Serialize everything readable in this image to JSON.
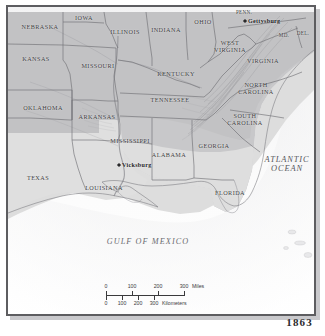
{
  "map": {
    "year": "1863",
    "states": [
      {
        "name": "NEBRASKA",
        "x": 40,
        "y": 27,
        "size": "state"
      },
      {
        "name": "IOWA",
        "x": 84,
        "y": 18,
        "size": "state"
      },
      {
        "name": "ILLINOIS",
        "x": 125,
        "y": 32,
        "size": "state"
      },
      {
        "name": "INDIANA",
        "x": 166,
        "y": 30,
        "size": "state"
      },
      {
        "name": "OHIO",
        "x": 203,
        "y": 22,
        "size": "state"
      },
      {
        "name": "PENN.",
        "x": 244,
        "y": 13,
        "size": "state-sm"
      },
      {
        "name": "MD.",
        "x": 284,
        "y": 36,
        "size": "state-sm"
      },
      {
        "name": "DEL.",
        "x": 303,
        "y": 34,
        "size": "state-sm"
      },
      {
        "name": "KANSAS",
        "x": 36,
        "y": 59,
        "size": "state"
      },
      {
        "name": "MISSOURI",
        "x": 98,
        "y": 66,
        "size": "state"
      },
      {
        "name": "KENTUCKY",
        "x": 176,
        "y": 74,
        "size": "state"
      },
      {
        "name": "WEST\nVIRGINIA",
        "x": 230,
        "y": 47,
        "size": "state"
      },
      {
        "name": "VIRGINIA",
        "x": 263,
        "y": 61,
        "size": "state"
      },
      {
        "name": "OKLAHOMA",
        "x": 43,
        "y": 108,
        "size": "state"
      },
      {
        "name": "ARKANSAS",
        "x": 97,
        "y": 117,
        "size": "state"
      },
      {
        "name": "TENNESSEE",
        "x": 170,
        "y": 100,
        "size": "state"
      },
      {
        "name": "NORTH\nCAROLINA",
        "x": 256,
        "y": 89,
        "size": "state"
      },
      {
        "name": "SOUTH\nCAROLINA",
        "x": 245,
        "y": 120,
        "size": "state"
      },
      {
        "name": "MISSISSIPPI",
        "x": 130,
        "y": 141,
        "size": "state"
      },
      {
        "name": "ALABAMA",
        "x": 169,
        "y": 155,
        "size": "state"
      },
      {
        "name": "GEORGIA",
        "x": 214,
        "y": 146,
        "size": "state"
      },
      {
        "name": "TEXAS",
        "x": 38,
        "y": 178,
        "size": "state"
      },
      {
        "name": "LOUISIANA",
        "x": 104,
        "y": 188,
        "size": "state"
      },
      {
        "name": "FLORIDA",
        "x": 230,
        "y": 193,
        "size": "state"
      }
    ],
    "water_labels": [
      {
        "name": "ATLANTIC\nOCEAN",
        "x": 287,
        "y": 165,
        "kind": "ocean"
      },
      {
        "name": "GULF OF MEXICO",
        "x": 148,
        "y": 242,
        "kind": "gulf"
      }
    ],
    "cities": [
      {
        "name": "Gettysburg",
        "x": 245,
        "y": 21,
        "label_dx": 3,
        "label_dy": 0
      },
      {
        "name": "Vicksburg",
        "x": 119,
        "y": 165,
        "label_dx": 3,
        "label_dy": 0
      }
    ],
    "colors": {
      "union_fill": "#c3c3c5",
      "confederate_fill": "#dddddd",
      "water": "#fbfbfb",
      "border_line": "#6e6e72",
      "frame": "#5d5d60",
      "label_text": "#3a3a3c"
    }
  },
  "scalebar": {
    "miles": {
      "unit": "Miles",
      "ticks": [
        "0",
        "100",
        "200",
        "300"
      ]
    },
    "kilometers": {
      "unit": "Kilometers",
      "ticks": [
        "0",
        "100",
        "200",
        "300"
      ]
    }
  }
}
